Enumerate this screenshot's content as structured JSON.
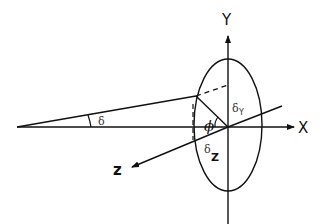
{
  "diagram": {
    "type": "geometry-3d-axes",
    "axes": {
      "x": {
        "label": "X"
      },
      "y": {
        "label": "Y"
      },
      "z": {
        "label": "z"
      }
    },
    "angles": {
      "delta": {
        "symbol": "δ"
      },
      "phi": {
        "symbol": "ϕ"
      }
    },
    "components": {
      "delta_y": {
        "base": "δ",
        "sub": "Y"
      },
      "delta_z": {
        "base": "δ",
        "sub": "Z"
      }
    },
    "shapes": {
      "ellipse": "cross-section ellipse in the Y-Z plane centered at origin",
      "ray": "line from far-left apex to ellipse boundary at angle δ",
      "radius": "segment from ellipse boundary point to origin at angle ϕ"
    },
    "colors": {
      "stroke": "#111111",
      "background": "#ffffff"
    }
  }
}
